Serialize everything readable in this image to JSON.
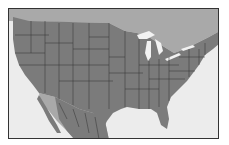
{
  "map": {
    "title": "",
    "region": "Contiguous United States with southern Canada and northern Mexico",
    "colors": {
      "water": "#ececec",
      "us_land": "#7b7b7b",
      "neighbor_land": "#a9a9a9",
      "lakes": "#f2f2f2",
      "borders": "#333333",
      "frame": "#333333"
    },
    "features": [
      "state-borders",
      "great-lakes",
      "gulf-of-mexico",
      "pacific-ocean",
      "atlantic-ocean",
      "canada",
      "mexico"
    ]
  }
}
